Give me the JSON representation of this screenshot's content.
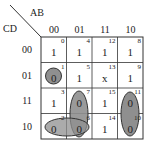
{
  "kmap": {
    "row_var": "CD",
    "col_var": "AB",
    "columns": [
      "00",
      "01",
      "11",
      "10"
    ],
    "rows": [
      "00",
      "01",
      "11",
      "10"
    ],
    "cells": [
      [
        {
          "index": "0",
          "value": "1"
        },
        {
          "index": "4",
          "value": "1"
        },
        {
          "index": "12",
          "value": "1"
        },
        {
          "index": "8",
          "value": "1"
        }
      ],
      [
        {
          "index": "1",
          "value": "0"
        },
        {
          "index": "5",
          "value": "1"
        },
        {
          "index": "13",
          "value": "x"
        },
        {
          "index": "9",
          "value": "1"
        }
      ],
      [
        {
          "index": "3",
          "value": "1"
        },
        {
          "index": "7",
          "value": "0"
        },
        {
          "index": "15",
          "value": "1"
        },
        {
          "index": "11",
          "value": "0"
        }
      ],
      [
        {
          "index": "2",
          "value": "0"
        },
        {
          "index": "6",
          "value": "0"
        },
        {
          "index": "14",
          "value": "1"
        },
        {
          "index": "10",
          "value": "0"
        }
      ]
    ],
    "groups": [
      {
        "name": "group-cell-1",
        "cells": [
          "1"
        ]
      },
      {
        "name": "group-cells-7-6",
        "cells": [
          "7",
          "6"
        ]
      },
      {
        "name": "group-cells-2-6",
        "cells": [
          "2",
          "6"
        ]
      },
      {
        "name": "group-cells-11-10",
        "cells": [
          "11",
          "10"
        ]
      }
    ],
    "colors": {
      "group_fill": "#8f8f8f",
      "line": "#333333"
    }
  }
}
